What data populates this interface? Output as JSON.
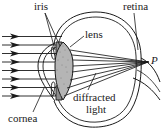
{
  "figure": {
    "type": "anatomical-ray-diagram",
    "width": 164,
    "height": 134,
    "background_color": "#ffffff",
    "line_color": "#1a1a1a",
    "lens_fill_color": "#b9b9b9"
  },
  "labels": {
    "iris": "iris",
    "retina": "retina",
    "lens": "lens",
    "point_p": "P",
    "diffracted_line1": "diffracted",
    "diffracted_line2": "light",
    "cornea": "cornea"
  },
  "rays": {
    "incoming_count": 8,
    "incoming_arrowheads": true,
    "converging_point_label": "P",
    "description": "Eight parallel horizontal light rays with arrowheads enter from the left, pass through the cornea and lens, and converge on point P at the retina."
  },
  "anatomy": {
    "parts": [
      "cornea",
      "iris",
      "lens",
      "retina",
      "optic nerve"
    ]
  }
}
